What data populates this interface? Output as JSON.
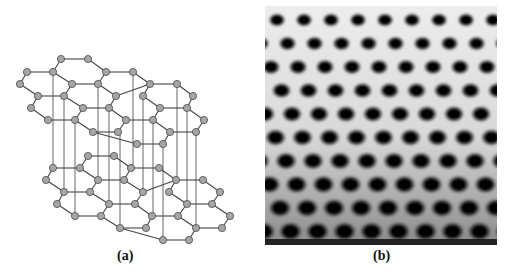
{
  "figure": {
    "panels": [
      {
        "id": "a",
        "label": "(a)",
        "description": "Ball-and-stick model of AB-stacked bilayer hexagonal lattice"
      },
      {
        "id": "b",
        "label": "(b)",
        "description": "Atomic-resolution microscopy image of hexagonal lattice"
      }
    ]
  },
  "colors": {
    "node_fill": "#a6a6a6",
    "node_stroke": "#4a4a4a",
    "bond": "#444444",
    "connector": "#666666",
    "image_dark": "#050505",
    "image_light": "#f2f2f2"
  },
  "lattice": {
    "node_radius": 3.6,
    "top_layer": [
      [
        61,
        59
      ],
      [
        88,
        59
      ],
      [
        27,
        72
      ],
      [
        53,
        72
      ],
      [
        106,
        72
      ],
      [
        133,
        72
      ],
      [
        20,
        84
      ],
      [
        72,
        84
      ],
      [
        98,
        84
      ],
      [
        150,
        84
      ],
      [
        177,
        84
      ],
      [
        38,
        96
      ],
      [
        64,
        96
      ],
      [
        116,
        96
      ],
      [
        143,
        96
      ],
      [
        193,
        96
      ],
      [
        31,
        108
      ],
      [
        83,
        108
      ],
      [
        109,
        108
      ],
      [
        160,
        108
      ],
      [
        187,
        108
      ],
      [
        48,
        120
      ],
      [
        75,
        120
      ],
      [
        126,
        120
      ],
      [
        153,
        120
      ],
      [
        204,
        120
      ],
      [
        93,
        132
      ],
      [
        118,
        132
      ],
      [
        170,
        132
      ],
      [
        196,
        132
      ],
      [
        137,
        144
      ],
      [
        163,
        144
      ]
    ],
    "top_bonds": [
      [
        0,
        1
      ],
      [
        0,
        3
      ],
      [
        1,
        4
      ],
      [
        3,
        2
      ],
      [
        2,
        6
      ],
      [
        6,
        11
      ],
      [
        11,
        12
      ],
      [
        12,
        7
      ],
      [
        7,
        3
      ],
      [
        4,
        8
      ],
      [
        8,
        7
      ],
      [
        4,
        5
      ],
      [
        5,
        9
      ],
      [
        9,
        13
      ],
      [
        13,
        8
      ],
      [
        9,
        10
      ],
      [
        10,
        15
      ],
      [
        15,
        20
      ],
      [
        20,
        19
      ],
      [
        19,
        14
      ],
      [
        14,
        9
      ],
      [
        12,
        17
      ],
      [
        17,
        18
      ],
      [
        18,
        13
      ],
      [
        11,
        16
      ],
      [
        16,
        21
      ],
      [
        21,
        22
      ],
      [
        22,
        17
      ],
      [
        18,
        23
      ],
      [
        23,
        24
      ],
      [
        24,
        19
      ],
      [
        20,
        25
      ],
      [
        25,
        29
      ],
      [
        29,
        28
      ],
      [
        28,
        24
      ],
      [
        22,
        26
      ],
      [
        26,
        27
      ],
      [
        27,
        23
      ],
      [
        28,
        31
      ],
      [
        31,
        30
      ],
      [
        30,
        26
      ]
    ],
    "bottom_layer": [
      [
        88,
        156
      ],
      [
        114,
        156
      ],
      [
        53,
        168
      ],
      [
        80,
        168
      ],
      [
        131,
        168
      ],
      [
        159,
        168
      ],
      [
        46,
        180
      ],
      [
        98,
        180
      ],
      [
        124,
        180
      ],
      [
        176,
        180
      ],
      [
        203,
        180
      ],
      [
        64,
        192
      ],
      [
        90,
        192
      ],
      [
        143,
        192
      ],
      [
        169,
        192
      ],
      [
        220,
        192
      ],
      [
        57,
        204
      ],
      [
        109,
        204
      ],
      [
        135,
        204
      ],
      [
        187,
        204
      ],
      [
        212,
        204
      ],
      [
        75,
        216
      ],
      [
        101,
        216
      ],
      [
        152,
        216
      ],
      [
        178,
        216
      ],
      [
        230,
        216
      ],
      [
        120,
        228
      ],
      [
        146,
        228
      ],
      [
        196,
        228
      ],
      [
        222,
        228
      ],
      [
        163,
        240
      ],
      [
        189,
        240
      ]
    ],
    "bottom_bonds": [
      [
        0,
        1
      ],
      [
        0,
        3
      ],
      [
        1,
        4
      ],
      [
        3,
        2
      ],
      [
        2,
        6
      ],
      [
        6,
        11
      ],
      [
        11,
        12
      ],
      [
        12,
        7
      ],
      [
        7,
        3
      ],
      [
        4,
        8
      ],
      [
        8,
        7
      ],
      [
        4,
        5
      ],
      [
        5,
        9
      ],
      [
        9,
        13
      ],
      [
        13,
        8
      ],
      [
        9,
        10
      ],
      [
        10,
        15
      ],
      [
        15,
        20
      ],
      [
        20,
        19
      ],
      [
        19,
        14
      ],
      [
        14,
        9
      ],
      [
        12,
        17
      ],
      [
        17,
        18
      ],
      [
        18,
        13
      ],
      [
        11,
        16
      ],
      [
        16,
        21
      ],
      [
        21,
        22
      ],
      [
        22,
        17
      ],
      [
        18,
        23
      ],
      [
        23,
        24
      ],
      [
        24,
        19
      ],
      [
        20,
        25
      ],
      [
        25,
        29
      ],
      [
        29,
        28
      ],
      [
        28,
        24
      ],
      [
        22,
        26
      ],
      [
        26,
        27
      ],
      [
        27,
        23
      ],
      [
        28,
        31
      ],
      [
        31,
        30
      ],
      [
        30,
        26
      ]
    ],
    "vertical_connectors": [
      [
        53,
        72,
        53,
        168
      ],
      [
        64,
        96,
        64,
        192
      ],
      [
        75,
        120,
        75,
        216
      ],
      [
        98,
        84,
        98,
        180
      ],
      [
        109,
        108,
        109,
        204
      ],
      [
        98,
        180,
        98,
        180
      ],
      [
        143,
        96,
        143,
        192
      ],
      [
        153,
        120,
        153,
        216
      ],
      [
        163,
        144,
        163,
        240
      ],
      [
        177,
        84,
        177,
        180
      ],
      [
        187,
        108,
        187,
        204
      ],
      [
        196,
        132,
        196,
        228
      ],
      [
        133,
        72,
        133,
        168
      ],
      [
        120,
        132,
        120,
        228
      ]
    ]
  },
  "micrograph": {
    "spacing_x": 27,
    "spacing_y": 23.5,
    "row_shift": 13.5,
    "skew": -0.22,
    "hole_radius_top": 8,
    "hole_radius_bottom": 12
  }
}
